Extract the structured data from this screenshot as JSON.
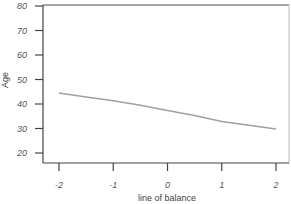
{
  "chart_data": {
    "type": "line",
    "title": "",
    "xlabel": "line of balance",
    "ylabel": "Age",
    "x_ticks": [
      "-2",
      "-1",
      "0",
      "1",
      "2"
    ],
    "y_ticks": [
      "20",
      "30",
      "40",
      "50",
      "60",
      "70",
      "80"
    ],
    "xlim": [
      -2,
      2
    ],
    "ylim": [
      20,
      80
    ],
    "grid": false,
    "legend": null,
    "series": [
      {
        "name": "Age",
        "x": [
          -2,
          -1.5,
          -1,
          -0.5,
          0,
          0.5,
          1,
          1.5,
          2
        ],
        "values": [
          44.5,
          42.8,
          41.3,
          39.5,
          37.3,
          35.3,
          32.8,
          31.3,
          29.8
        ],
        "color": "#a0a0a0"
      }
    ]
  },
  "colors": {
    "axis": "#444444",
    "frame": "#888888",
    "line": "#a0a0a0",
    "text": "#555555"
  }
}
